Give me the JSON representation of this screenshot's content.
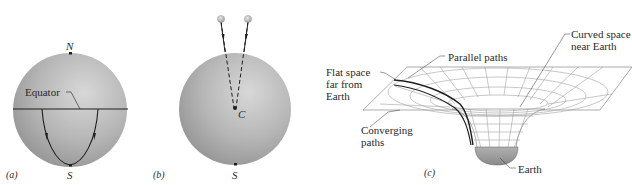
{
  "figure": {
    "panels": [
      {
        "id": "a",
        "label": "(a)",
        "pole_north": "N",
        "pole_south": "S",
        "equator_label": "Equator",
        "description": "Sphere with two paths leaving the equator perpendicular (parallel) and converging at the south pole"
      },
      {
        "id": "b",
        "label": "(b)",
        "center_label": "C",
        "pole_south": "S",
        "description": "Two falling balls whose dashed paths converge toward the center C of the sphere"
      },
      {
        "id": "c",
        "label": "(c)",
        "labels": {
          "flat_space": "Flat space far from Earth",
          "flat_space_lines": [
            "Flat space",
            "far from",
            "Earth"
          ],
          "parallel_paths": "Parallel paths",
          "curved_space": "Curved space near Earth",
          "curved_space_lines": [
            "Curved space",
            "near Earth"
          ],
          "converging_paths": "Converging paths",
          "converging_lines": [
            "Converging",
            "paths"
          ],
          "earth": "Earth"
        },
        "description": "Grid surface (spacetime) dipping into a funnel around Earth; parallel paths converge near Earth"
      }
    ],
    "colors": {
      "sphere_light": "#d6d6d6",
      "sphere_mid": "#b4b4b4",
      "sphere_dark": "#8f8f8f",
      "ink": "#1e1e1e",
      "grid": "#9a9a9a",
      "earth": "#9d9d9d",
      "ball": "#c9c9c9"
    }
  }
}
